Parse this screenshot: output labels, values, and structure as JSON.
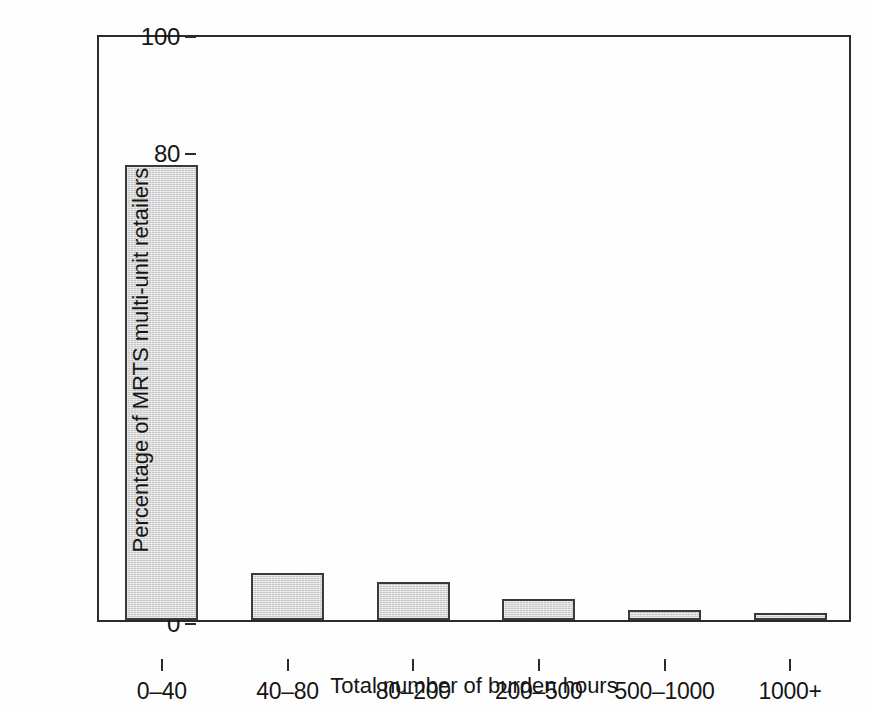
{
  "chart_data": {
    "type": "bar",
    "title": "",
    "subtitle": "",
    "xlabel": "Total number of burden hours",
    "ylabel": "Percentage of MRTS multi-unit retailers",
    "categories": [
      "0–40",
      "40–80",
      "80–200",
      "200–500",
      "500–1000",
      "1000+"
    ],
    "values": [
      77.5,
      8.0,
      6.5,
      3.6,
      1.7,
      1.2
    ],
    "series": [
      {
        "name": "Percentage of MRTS multi-unit retailers",
        "values": [
          77.5,
          8.0,
          6.5,
          3.6,
          1.7,
          1.2
        ]
      }
    ],
    "ylim": [
      0,
      100
    ],
    "yticks": [
      0,
      20,
      40,
      60,
      80,
      100
    ],
    "ytick_labels": [
      "0",
      "20",
      "40",
      "60",
      "80",
      "100"
    ],
    "grid": false,
    "legend": false,
    "legend_position": "none",
    "bar_fill_color": "#dcdcdc",
    "bar_edge_color": "#3a3a3a",
    "axis_color": "#2b2b2b",
    "background_color": "#fefefe"
  },
  "axes": {
    "y_title": "Percentage of MRTS multi-unit retailers",
    "x_title": "Total number of burden hours",
    "y_ticks": [
      {
        "label": "100",
        "value": 100
      },
      {
        "label": "80",
        "value": 80
      },
      {
        "label": "60",
        "value": 60
      },
      {
        "label": "40",
        "value": 40
      },
      {
        "label": "20",
        "value": 20
      },
      {
        "label": "0",
        "value": 0
      }
    ],
    "x_ticks": [
      {
        "label": "0–40"
      },
      {
        "label": "40–80"
      },
      {
        "label": "80–200"
      },
      {
        "label": "200–500"
      },
      {
        "label": "500–1000"
      },
      {
        "label": "1000+"
      }
    ]
  }
}
